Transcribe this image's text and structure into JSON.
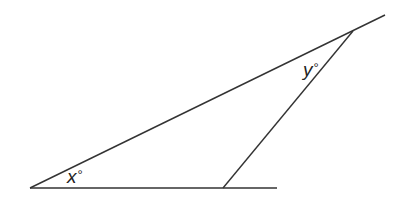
{
  "diagram": {
    "type": "geometry-triangle",
    "stroke_color": "#333333",
    "points": {
      "left_vertex": [
        30,
        188
      ],
      "bottom_vertex": [
        223,
        188
      ],
      "top_vertex": [
        353,
        31
      ]
    },
    "lines": [
      {
        "name": "base-line",
        "from": [
          30,
          188
        ],
        "to": [
          277,
          188
        ]
      },
      {
        "name": "long-side-line",
        "from": [
          30,
          188
        ],
        "to": [
          385,
          15
        ]
      },
      {
        "name": "short-side-line",
        "from": [
          223,
          188
        ],
        "to": [
          353,
          31
        ]
      }
    ],
    "labels": {
      "x_angle": {
        "var": "x",
        "unit": "°"
      },
      "y_angle": {
        "var": "y",
        "unit": "°"
      }
    }
  }
}
